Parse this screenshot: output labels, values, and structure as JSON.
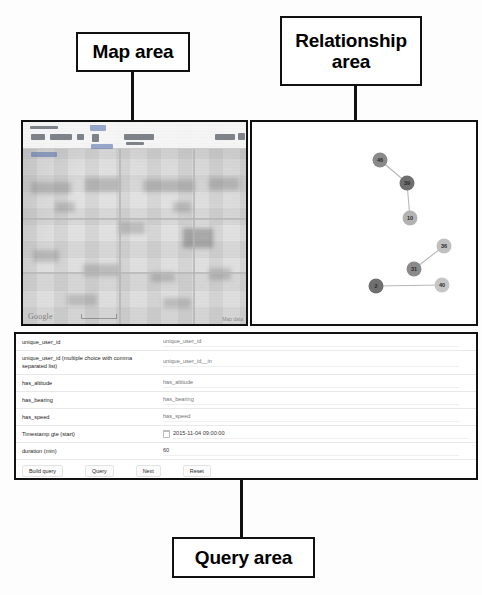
{
  "annotations": {
    "map_label": "Map area",
    "relationship_label": "Relationship\narea",
    "relationship_line1": "Relationship",
    "relationship_line2": "area",
    "query_label": "Query area"
  },
  "map": {
    "provider_watermark": "Google",
    "attribution": "Map data",
    "scale_label": ""
  },
  "relationship": {
    "nodes": [
      {
        "id": "n1",
        "label": "46",
        "x": 128,
        "y": 38,
        "r": 7.5,
        "shade": "#8a8a8a"
      },
      {
        "id": "n2",
        "label": "39",
        "x": 155,
        "y": 61,
        "r": 7.5,
        "shade": "#6f6f6f"
      },
      {
        "id": "n3",
        "label": "10",
        "x": 158,
        "y": 96,
        "r": 7.5,
        "shade": "#b3b3b3"
      },
      {
        "id": "n4",
        "label": "36",
        "x": 192,
        "y": 124,
        "r": 7.5,
        "shade": "#c0c0c0"
      },
      {
        "id": "n5",
        "label": "31",
        "x": 162,
        "y": 147,
        "r": 7.5,
        "shade": "#8a8a8a"
      },
      {
        "id": "n6",
        "label": "2",
        "x": 124,
        "y": 164,
        "r": 7.5,
        "shade": "#6f6f6f"
      },
      {
        "id": "n7",
        "label": "40",
        "x": 190,
        "y": 163,
        "r": 7.5,
        "shade": "#c6c6c6"
      }
    ],
    "edges": [
      {
        "from": "n1",
        "to": "n2"
      },
      {
        "from": "n2",
        "to": "n3"
      },
      {
        "from": "n4",
        "to": "n5"
      },
      {
        "from": "n6",
        "to": "n7"
      }
    ]
  },
  "query_form": {
    "rows": [
      {
        "label": "unique_user_id",
        "placeholder": "unique_user_id",
        "value": "",
        "type": "text"
      },
      {
        "label": "unique_user_id (multiple choice with comma separated list)",
        "placeholder": "unique_user_id__in",
        "value": "",
        "type": "text"
      },
      {
        "label": "has_altitude",
        "placeholder": "has_altitude",
        "value": "",
        "type": "text"
      },
      {
        "label": "has_bearing",
        "placeholder": "has_bearing",
        "value": "",
        "type": "text"
      },
      {
        "label": "has_speed",
        "placeholder": "has_speed",
        "value": "",
        "type": "text"
      },
      {
        "label": "Timestamp gte (start)",
        "placeholder": "",
        "value": "2015-11-04 09:00:00",
        "type": "datetime"
      },
      {
        "label": "duration (min)",
        "placeholder": "",
        "value": "60",
        "type": "number"
      }
    ],
    "buttons": [
      {
        "name": "build-query",
        "label": "Build query"
      },
      {
        "name": "query",
        "label": "Query"
      },
      {
        "name": "next",
        "label": "Next"
      },
      {
        "name": "reset",
        "label": "Reset"
      }
    ],
    "output": "Query: {\"unique_user_id\":\"\",\"unique_user_id__in\":\"\",\"has_altitude\":\"\",\"has_bearing\":\"\",\"has_speed\":\"\",\"timestamp__gte\":\"2015-11-04T00:00:00.000Z\",\"timestamp__lt\":\"2015-11-04T01:00:00.000Z\"}"
  },
  "colors": {
    "annotation_border": "#111111",
    "panel_border": "#111111",
    "node_fill_dark": "#6f6f6f",
    "node_fill_light": "#c6c6c6",
    "edge_stroke": "#b8b8b8"
  }
}
